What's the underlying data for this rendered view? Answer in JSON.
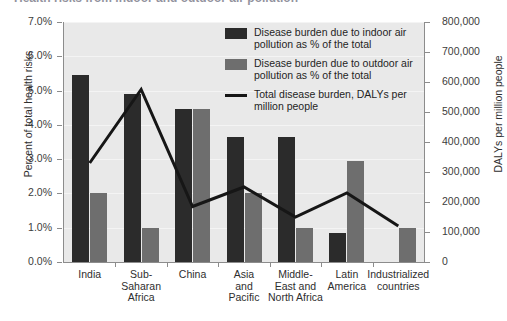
{
  "title_partial": "Health risks from indoor and outdoor air pollution",
  "axes": {
    "left": {
      "label": "Percent of total health risks",
      "ticks": [
        "0.0%",
        "1.0%",
        "2.0%",
        "3.0%",
        "4.0%",
        "5.0%",
        "6.0%",
        "7.0%"
      ],
      "min": 0,
      "max": 7
    },
    "right": {
      "label": "DALYs per million people",
      "ticks": [
        "0",
        "100,000",
        "200,000",
        "300,000",
        "400,000",
        "500,000",
        "600,000",
        "700,000",
        "800,000"
      ],
      "min": 0,
      "max": 800000
    }
  },
  "legend": [
    {
      "id": "indoor",
      "marker": "square-dark",
      "text": "Disease burden due to indoor air pollution as % of the total"
    },
    {
      "id": "outdoor",
      "marker": "square-gray",
      "text": "Disease burden due to outdoor air pollution as % of the total"
    },
    {
      "id": "total",
      "marker": "line-black",
      "text": "Total disease burden, DALYs per million people"
    }
  ],
  "chart_data": {
    "type": "bar",
    "title": "Health risks from indoor and outdoor air pollution",
    "xlabel": "",
    "ylabel": "Percent of total health risks",
    "y2label": "DALYs per million people",
    "ylim": [
      0,
      7
    ],
    "y2lim": [
      0,
      800000
    ],
    "grid": true,
    "legend_position": "upper-right-inside",
    "categories": [
      "India",
      "Sub-Saharan Africa",
      "China",
      "Asia and Pacific",
      "Middle-East and North Africa",
      "Latin America",
      "Industrialized countries"
    ],
    "category_lines": [
      [
        "India"
      ],
      [
        "Sub-",
        "Saharan",
        "Africa"
      ],
      [
        "China"
      ],
      [
        "Asia",
        "and",
        "Pacific"
      ],
      [
        "Middle-",
        "East and",
        "North Africa"
      ],
      [
        "Latin",
        "America"
      ],
      [
        "Industrialized",
        "countries"
      ]
    ],
    "series": [
      {
        "name": "Disease burden due to indoor air pollution as % of the total",
        "type": "bar",
        "axis": "left",
        "unit": "%",
        "color": "#2b2b2b",
        "values": [
          5.45,
          4.9,
          4.45,
          3.65,
          3.65,
          0.85,
          0.0
        ]
      },
      {
        "name": "Disease burden due to outdoor air pollution as % of the total",
        "type": "bar",
        "axis": "left",
        "unit": "%",
        "color": "#6e6e6e",
        "values": [
          2.0,
          1.0,
          4.45,
          2.0,
          1.0,
          2.95,
          1.0
        ]
      },
      {
        "name": "Total disease burden, DALYs per million people",
        "type": "line",
        "axis": "right",
        "unit": "DALYs per million",
        "color": "#161616",
        "values": [
          330000,
          575000,
          185000,
          250000,
          150000,
          230000,
          120000
        ]
      }
    ]
  }
}
